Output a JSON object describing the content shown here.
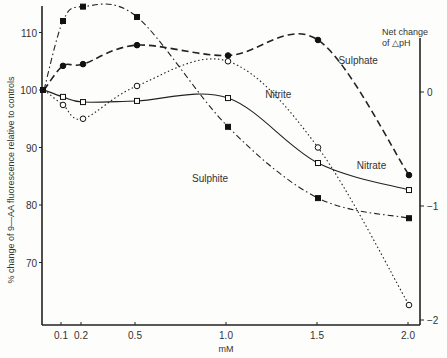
{
  "chart_data": {
    "type": "line",
    "title": "",
    "xlabel": "mM",
    "ylabel": "% change of 9—AA fluorescence relative to controls",
    "y2label": [
      "Net change",
      "of △pH"
    ],
    "xlim": [
      0,
      2.05
    ],
    "ylim": [
      59,
      115
    ],
    "y2lim": [
      -2,
      0
    ],
    "x_ticks": [
      0.1,
      0.2,
      0.5,
      1.0,
      1.5,
      2.0
    ],
    "x_tick_labels": [
      "0.1",
      "0.2",
      "0.5",
      "1.0",
      "1.5",
      "2.0"
    ],
    "y_ticks": [
      70,
      80,
      90,
      100,
      110
    ],
    "y_tick_labels": [
      "70",
      "80",
      "90",
      "100",
      "110"
    ],
    "y2_ticks": [
      0,
      -1,
      -2
    ],
    "y2_tick_labels": [
      "0",
      "−1",
      "−2"
    ],
    "grid": false,
    "legend": "inline labels",
    "x": [
      0.0,
      0.1,
      0.2,
      0.5,
      1.0,
      1.5,
      2.0
    ],
    "series": [
      {
        "name": "Sulphite",
        "marker": "filled-square",
        "line": "dash-dot",
        "values": [
          100,
          112,
          114.5,
          112.7,
          93.6,
          81.2,
          77.7
        ]
      },
      {
        "name": "Sulphate",
        "marker": "filled-circle",
        "line": "dashed",
        "values": [
          100,
          104.2,
          104.5,
          107.8,
          106.0,
          108.7,
          85.2
        ]
      },
      {
        "name": "Nitrite",
        "marker": "open-circle",
        "line": "dotted",
        "values": [
          100,
          97.4,
          95.0,
          100.7,
          105.0,
          90.0,
          62.6
        ]
      },
      {
        "name": "Nitrate",
        "marker": "open-square",
        "line": "solid",
        "values": [
          100,
          98.8,
          97.9,
          98.1,
          98.6,
          87.3,
          82.6
        ]
      }
    ],
    "annotations": [
      {
        "text": "Sulphate",
        "x": 1.62,
        "y": 104.5
      },
      {
        "text": "Nitrite",
        "x": 1.22,
        "y": 98.6
      },
      {
        "text": "Nitrate",
        "x": 1.72,
        "y": 86.3
      },
      {
        "text": "Sulphite",
        "x": 0.82,
        "y": 84.0
      }
    ]
  }
}
